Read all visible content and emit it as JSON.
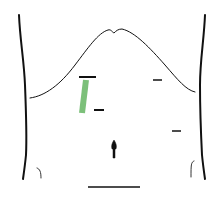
{
  "diagram": {
    "colors": {
      "background": "#ffffff",
      "outline": "#111111",
      "incision": "#7cc07a"
    },
    "marks": [
      {
        "name": "subxiphoid-port-mark",
        "x1": 79,
        "y1": 77,
        "x2": 96,
        "y2": 77
      },
      {
        "name": "left-upper-port-mark",
        "x1": 153,
        "y1": 80,
        "x2": 162,
        "y2": 80
      },
      {
        "name": "right-mid-port-mark",
        "x1": 94,
        "y1": 110,
        "x2": 104,
        "y2": 110
      },
      {
        "name": "left-lower-port-mark",
        "x1": 172,
        "y1": 131,
        "x2": 181,
        "y2": 131
      },
      {
        "name": "pubic-line-mark",
        "x1": 88,
        "y1": 187,
        "x2": 140,
        "y2": 187
      }
    ]
  }
}
